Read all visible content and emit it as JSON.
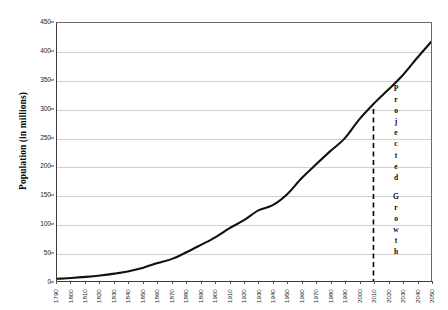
{
  "chart_data": {
    "type": "line",
    "title": "",
    "xlabel": "",
    "ylabel": "Population (in millions)",
    "ylim": [
      0,
      450
    ],
    "ytick_values": [
      0,
      50,
      100,
      150,
      200,
      250,
      300,
      350,
      400,
      450
    ],
    "ytick_labels": [
      "0",
      "50",
      "100",
      "150",
      "200",
      "250",
      "300",
      "350",
      "400",
      "450"
    ],
    "grid": true,
    "legend": "none",
    "xlim": [
      "1790",
      "2050"
    ],
    "categories": [
      "1790",
      "1800",
      "1810",
      "1820",
      "1830",
      "1840",
      "1850",
      "1860",
      "1870",
      "1880",
      "1890",
      "1900",
      "1910",
      "1920",
      "1930",
      "1940",
      "1950",
      "1960",
      "1970",
      "1980",
      "1990",
      "2000",
      "2010",
      "2020",
      "2030",
      "2040",
      "2050"
    ],
    "series": [
      {
        "name": "Population",
        "color": "#111111",
        "values": [
          3.9,
          5.3,
          7.2,
          9.6,
          12.9,
          17.1,
          23.2,
          31.4,
          38.6,
          50.2,
          63.0,
          76.2,
          92.2,
          106.0,
          123.2,
          132.2,
          151.3,
          179.3,
          203.2,
          226.5,
          248.7,
          281.4,
          308.7,
          333.0,
          358.0,
          388.0,
          417.0
        ]
      }
    ],
    "annotations": [
      {
        "name": "projected-divider",
        "type": "vline",
        "x": "2010",
        "y_top": 300,
        "style": "dashed",
        "color": "#000000"
      },
      {
        "name": "projected-label",
        "type": "text-vertical",
        "text": "Projected",
        "letters": [
          "P",
          "r",
          "o",
          "j",
          "e",
          "c",
          "t",
          "e",
          "d"
        ]
      },
      {
        "name": "growth-label",
        "type": "text-vertical",
        "text": "Growth",
        "letters": [
          "G",
          "r",
          "o",
          "w",
          "t",
          "h"
        ]
      }
    ],
    "colors": {
      "line": "#111111",
      "gridline": "#cfcfcf",
      "axis": "#3a3a3a",
      "plot_border": "#6a6a6a",
      "background": "#ffffff",
      "text": "#0a0a0a"
    }
  }
}
